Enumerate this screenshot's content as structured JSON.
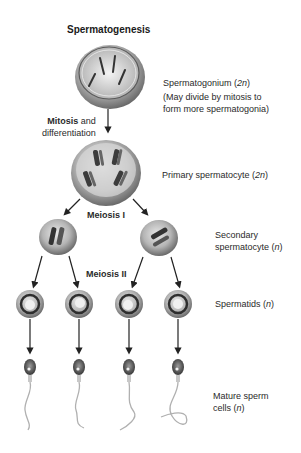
{
  "title": "Spermatogenesis",
  "stages": {
    "spermatogonium": {
      "name": "Spermatogonium",
      "ploidy": "2n",
      "note_line1": "(May divide by mitosis to",
      "note_line2": "form more spermatogonia)"
    },
    "primary": {
      "name": "Primary spermatocyte",
      "ploidy": "2n"
    },
    "secondary": {
      "line1": "Secondary",
      "line2": "spermatocyte",
      "ploidy": "n"
    },
    "spermatids": {
      "name": "Spermatids",
      "ploidy": "n"
    },
    "mature": {
      "line1": "Mature sperm",
      "line2": "cells",
      "ploidy": "n"
    }
  },
  "processes": {
    "mitosis": {
      "bold": "Mitosis",
      "rest": " and",
      "line2": "differentiation"
    },
    "meiosis1": "Meiosis I",
    "meiosis2": "Meiosis II"
  },
  "colors": {
    "cell_fill": "#b8b8b8",
    "cell_dark": "#6e6e6e",
    "chromosome": "#3a3a3a",
    "arrow": "#222222",
    "text": "#2a2a2a"
  }
}
